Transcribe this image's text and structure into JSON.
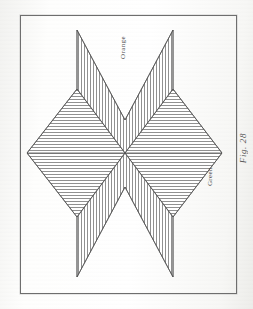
{
  "page": {
    "kind": "scanned-book-plate",
    "background_color": "#fdfdfc",
    "ink_color": "#555555"
  },
  "plate": {
    "frame": {
      "border_color": "#6e6e6e",
      "x": 20,
      "y": 15,
      "width": 215,
      "height": 277
    }
  },
  "caption": {
    "text": "Fig. 28"
  },
  "labels": {
    "orange": "Orange",
    "green": "Green"
  },
  "chart_data": {
    "type": "diagram",
    "title": "Fig. 28",
    "orientation": "rotated-90-clockwise",
    "center": [
      125,
      153
    ],
    "grid": false,
    "legend": "inline-labels",
    "regions": [
      {
        "name": "Orange",
        "label": "Orange",
        "position": "top",
        "shape": "chevron",
        "hatch": "vertical",
        "hatch_spacing_px": 3,
        "hatch_color": "#6b6b6b",
        "points": "77,30 125,120 173,30 173,153 125,153 77,153"
      },
      {
        "name": "Orange",
        "label": "Orange",
        "position": "bottom",
        "shape": "chevron",
        "hatch": "vertical",
        "hatch_spacing_px": 3,
        "hatch_color": "#6b6b6b",
        "points": "77,153 125,153 173,153 173,277 125,187 77,277"
      },
      {
        "name": "Green",
        "label": "Green",
        "position": "left",
        "shape": "diamond",
        "hatch": "horizontal",
        "hatch_spacing_px": 3,
        "hatch_color": "#6b6b6b",
        "points": "27,153 77,89 125,153 77,217"
      },
      {
        "name": "Green",
        "label": "Green",
        "position": "right",
        "shape": "diamond",
        "hatch": "horizontal",
        "hatch_spacing_px": 3,
        "hatch_color": "#6b6b6b",
        "points": "125,153 173,89 222,153 173,217"
      }
    ],
    "extremes": {
      "left_tip": [
        27,
        153
      ],
      "right_tip": [
        222,
        153
      ],
      "top_left_arm": [
        77,
        30
      ],
      "top_right_arm": [
        173,
        30
      ],
      "bottom_left_arm": [
        77,
        277
      ],
      "bottom_right_arm": [
        173,
        277
      ],
      "top_notch": [
        125,
        120
      ],
      "bottom_notch": [
        125,
        187
      ]
    }
  }
}
